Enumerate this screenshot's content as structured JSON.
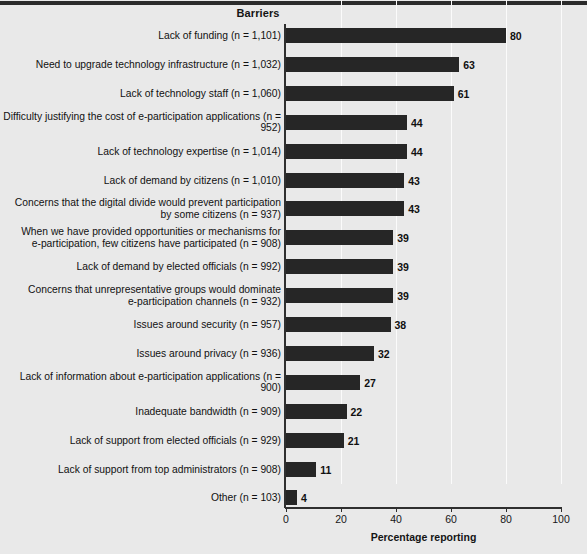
{
  "chart_data": {
    "type": "bar",
    "orientation": "horizontal",
    "title": "Barriers",
    "xlabel": "Percentage reporting",
    "ylabel": "",
    "xlim": [
      0,
      100
    ],
    "xticks": [
      0,
      20,
      40,
      60,
      80,
      100
    ],
    "grid": true,
    "legend": null,
    "bar_color": "#262626",
    "background_color": "#e9e9e9",
    "categories": [
      "Lack of funding (n = 1,101)",
      "Need to upgrade technology infrastructure (n = 1,032)",
      "Lack of technology staff (n = 1,060)",
      "Difficulty justifying the cost of e-participation applications (n = 952)",
      "Lack of technology expertise (n = 1,014)",
      "Lack of demand by citizens (n = 1,010)",
      "Concerns that the digital divide would prevent participation\nby some citizens (n = 937)",
      "When we have provided opportunities or mechanisms for\ne-participation, few citizens have participated (n = 908)",
      "Lack of demand by elected officials (n = 992)",
      "Concerns that unrepresentative groups would dominate\ne-participation channels (n = 932)",
      "Issues around security (n = 957)",
      "Issues around privacy (n = 936)",
      "Lack of information about e-participation applications (n = 900)",
      "Inadequate bandwidth (n = 909)",
      "Lack of support from elected officials (n = 929)",
      "Lack of support from top administrators (n = 908)",
      "Other (n = 103)"
    ],
    "values": [
      80,
      63,
      61,
      44,
      44,
      43,
      43,
      39,
      39,
      39,
      38,
      32,
      27,
      22,
      21,
      11,
      4
    ]
  }
}
